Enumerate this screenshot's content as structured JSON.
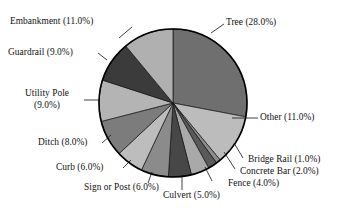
{
  "chart_data": {
    "type": "pie",
    "title": "",
    "subtitle": "",
    "xlabel": "",
    "ylabel": "",
    "grid": false,
    "legend_position": "none",
    "label_format": "name (value%)",
    "start_angle_deg": 0,
    "direction": "clockwise",
    "units": "percent",
    "total": 100.0,
    "categories": [
      "Tree",
      "Other",
      "Bridge Rail",
      "Concrete Bar",
      "Fence",
      "Culvert",
      "Sign or Post",
      "Curb",
      "Ditch",
      "Utility Pole",
      "Guardrail",
      "Embankment"
    ],
    "values": [
      28.0,
      11.0,
      1.0,
      2.0,
      4.0,
      5.0,
      6.0,
      6.0,
      8.0,
      9.0,
      9.0,
      11.0
    ],
    "slices": [
      {
        "name": "Tree",
        "value": 28.0,
        "label": "Tree (28.0%)",
        "color": "#6f6f6f"
      },
      {
        "name": "Other",
        "value": 11.0,
        "label": "Other (11.0%)",
        "color": "#bcbcbc"
      },
      {
        "name": "Bridge Rail",
        "value": 1.0,
        "label": "Bridge Rail (1.0%)",
        "color": "#8e8e8e"
      },
      {
        "name": "Concrete Bar",
        "value": 2.0,
        "label": "Concrete Bar (2.0%)",
        "color": "#5a5a5a"
      },
      {
        "name": "Fence",
        "value": 4.0,
        "label": "Fence (4.0%)",
        "color": "#a9a9a9"
      },
      {
        "name": "Culvert",
        "value": 5.0,
        "label": "Culvert (5.0%)",
        "color": "#474747"
      },
      {
        "name": "Sign or Post",
        "value": 6.0,
        "label": "Sign or Post (6.0%)",
        "color": "#8b8b8b"
      },
      {
        "name": "Curb",
        "value": 6.0,
        "label": "Curb (6.0%)",
        "color": "#bdbdbd"
      },
      {
        "name": "Ditch",
        "value": 8.0,
        "label": "Ditch (8.0%)",
        "color": "#7c7c7c"
      },
      {
        "name": "Utility Pole",
        "value": 9.0,
        "label": "Utility Pole (9.0%)",
        "color": "#b4b4b4"
      },
      {
        "name": "Guardrail",
        "value": 9.0,
        "label": "Guardrail (9.0%)",
        "color": "#3b3b3b"
      },
      {
        "name": "Embankment",
        "value": 11.0,
        "label": "Embankment (11.0%)",
        "color": "#b0b0b0"
      }
    ],
    "geometry": {
      "center_x": 173,
      "center_y": 103,
      "radius": 74,
      "outline_color": "#000000"
    }
  },
  "labels": {
    "embankment": "Embankment (11.0%)",
    "guardrail": "Guardrail (9.0%)",
    "utility_pole_name": "Utility Pole",
    "utility_pole_value": "(9.0%)",
    "ditch": "Ditch (8.0%)",
    "curb": "Curb (6.0%)",
    "sign_or_post": "Sign or Post (6.0%)",
    "culvert": "Culvert (5.0%)",
    "fence": "Fence (4.0%)",
    "concrete_bar": "Concrete Bar (2.0%)",
    "bridge_rail": "Bridge Rail (1.0%)",
    "other": "Other (11.0%)",
    "tree": "Tree (28.0%)"
  }
}
